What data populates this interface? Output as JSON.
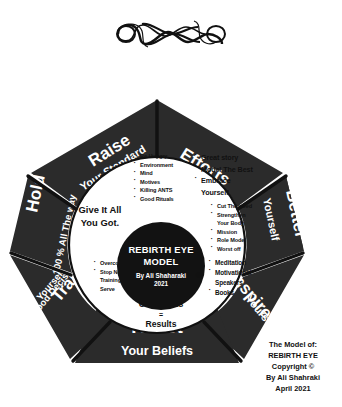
{
  "ornament": {
    "name": "decorative-flourish"
  },
  "diagram": {
    "title": "REBIRTH EYE MODEL",
    "center": {
      "line1": "REBIRTH EYE",
      "line2": "MODEL",
      "author": "By Ali Shaharaki",
      "year": "2021",
      "copyright_mark": "©"
    },
    "equation": {
      "term1": "Action",
      "op1": "+",
      "term2": "Certainties",
      "op2": "=",
      "term3": "Results"
    },
    "give_it_all": "Give It All\nYou Got.",
    "give_it_all_line1": "Give It All",
    "give_it_all_line2": "You Got.",
    "sectors": [
      {
        "id": "raise",
        "heading": "Raise",
        "subheading": "Your Standard",
        "items": [
          "Be Hungry",
          "Environment",
          "Mind",
          "Motives",
          "Killing ANTS",
          "Good Rituals"
        ]
      },
      {
        "id": "efforts",
        "heading": "Efforts",
        "subheading": "To Change Your",
        "subheading2": "Story",
        "items": [
          "Great story",
          "Model The Best",
          "Embrace",
          "Yourself"
        ]
      },
      {
        "id": "better",
        "heading": "Better",
        "subheading": "Yourself",
        "items": [
          "Cut The weed",
          "Strengthen",
          "Your Body",
          "Mission",
          "Role Model",
          "Worst off"
        ]
      },
      {
        "id": "inspire",
        "heading": "Inspire",
        "subheading": "Yourself",
        "items": [
          "Meditation",
          "Motivational",
          "Speakers",
          "Books"
        ]
      },
      {
        "id": "reset",
        "heading": "Reset",
        "subheading": "Your Beliefs",
        "items": []
      },
      {
        "id": "train",
        "heading": "Train",
        "subheading": "Yourself In Making",
        "subheading2": "Good Decision",
        "items": [
          "Overcome Habits",
          "Stop Negative",
          "Training",
          "Serve"
        ]
      },
      {
        "id": "hold",
        "heading": "Hold",
        "subheading": "100 % All The way",
        "items": []
      }
    ]
  },
  "credit": {
    "line1": "The Model of:",
    "line2": "REBIRTH EYE",
    "line3": "Copyright ©",
    "line4": "By Ali Shahraki",
    "line5": "April 2021"
  },
  "colors": {
    "ink": "#121212",
    "paper": "#ffffff",
    "sector_fill": "#2b2b2b",
    "text_on_dark": "#ffffff"
  }
}
